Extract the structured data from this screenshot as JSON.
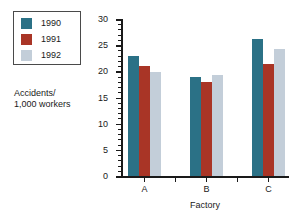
{
  "chart_data": {
    "type": "bar",
    "title": "",
    "subtitle": "",
    "xlabel": "Factory",
    "ylabel": "Accidents/\n1,000 workers",
    "ylabel_lines": [
      "Accidents/",
      "1,000 workers"
    ],
    "categories": [
      "A",
      "B",
      "C"
    ],
    "series": [
      {
        "name": "1990",
        "color": "#2b7186",
        "values": [
          23.0,
          19.0,
          26.1
        ]
      },
      {
        "name": "1991",
        "color": "#a93526",
        "values": [
          21.0,
          17.9,
          21.4
        ]
      },
      {
        "name": "1992",
        "color": "#c3ced9",
        "values": [
          19.8,
          19.3,
          24.2
        ]
      }
    ],
    "ylim": [
      0,
      30
    ],
    "ytick_labels": [
      "0",
      "5",
      "10",
      "15",
      "20",
      "25",
      "30"
    ],
    "ytick_values": [
      0,
      5,
      10,
      15,
      20,
      25,
      30
    ],
    "yminor_step": 1,
    "grid": false,
    "legend_position": "top-left-outside",
    "axis_color": "#1a1a1a",
    "background": "#ffffff"
  },
  "legend": {
    "items": [
      {
        "label": "1990",
        "color": "#2b7186"
      },
      {
        "label": "1991",
        "color": "#a93526"
      },
      {
        "label": "1992",
        "color": "#c3ced9"
      }
    ]
  }
}
